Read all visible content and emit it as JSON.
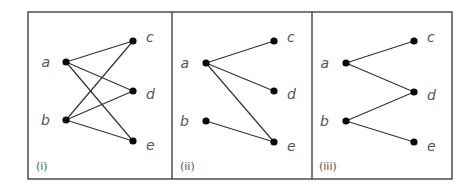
{
  "figure": {
    "frame": {
      "x": 28,
      "y": 12,
      "width": 424,
      "height": 167
    },
    "dividers": [
      172,
      312
    ],
    "colors": {
      "edge": "#333333",
      "node": "#0a0a0a",
      "text": "#555555",
      "frame": "#333333"
    },
    "panels": [
      {
        "id": "i",
        "label": "(i)",
        "label_pos": {
          "x": 36,
          "y": 170
        },
        "nodes": [
          {
            "id": "a",
            "label": "a",
            "x": 66,
            "y": 62,
            "lx": 50,
            "ly": 67
          },
          {
            "id": "b",
            "label": "b",
            "x": 66,
            "y": 120,
            "lx": 50,
            "ly": 125
          },
          {
            "id": "c",
            "label": "c",
            "x": 133,
            "y": 41,
            "lx": 146,
            "ly": 42
          },
          {
            "id": "d",
            "label": "d",
            "x": 133,
            "y": 91,
            "lx": 146,
            "ly": 99
          },
          {
            "id": "e",
            "label": "e",
            "x": 133,
            "y": 141,
            "lx": 146,
            "ly": 150
          }
        ],
        "edges": [
          [
            "a",
            "c"
          ],
          [
            "a",
            "d"
          ],
          [
            "a",
            "e"
          ],
          [
            "b",
            "c"
          ],
          [
            "b",
            "d"
          ],
          [
            "b",
            "e"
          ]
        ]
      },
      {
        "id": "ii",
        "label": "(ii)",
        "label_pos": {
          "x": 180,
          "y": 170
        },
        "nodes": [
          {
            "id": "a",
            "label": "a",
            "x": 206,
            "y": 63,
            "lx": 189,
            "ly": 68
          },
          {
            "id": "b",
            "label": "b",
            "x": 206,
            "y": 121,
            "lx": 189,
            "ly": 126
          },
          {
            "id": "c",
            "label": "c",
            "x": 274,
            "y": 41,
            "lx": 287,
            "ly": 42
          },
          {
            "id": "d",
            "label": "d",
            "x": 274,
            "y": 91,
            "lx": 287,
            "ly": 99
          },
          {
            "id": "e",
            "label": "e",
            "x": 274,
            "y": 142,
            "lx": 287,
            "ly": 151
          }
        ],
        "edges": [
          [
            "a",
            "c"
          ],
          [
            "a",
            "d"
          ],
          [
            "a",
            "e"
          ],
          [
            "b",
            "e"
          ]
        ]
      },
      {
        "id": "iii",
        "label": "(iii)",
        "label_pos": {
          "x": 319,
          "y": 170
        },
        "nodes": [
          {
            "id": "a",
            "label": "a",
            "x": 346,
            "y": 63,
            "lx": 329,
            "ly": 68
          },
          {
            "id": "b",
            "label": "b",
            "x": 346,
            "y": 121,
            "lx": 329,
            "ly": 126
          },
          {
            "id": "c",
            "label": "c",
            "x": 414,
            "y": 41,
            "lx": 427,
            "ly": 42
          },
          {
            "id": "d",
            "label": "d",
            "x": 414,
            "y": 92,
            "lx": 427,
            "ly": 100
          },
          {
            "id": "e",
            "label": "e",
            "x": 414,
            "y": 142,
            "lx": 427,
            "ly": 151
          }
        ],
        "edges": [
          [
            "a",
            "c"
          ],
          [
            "a",
            "d"
          ],
          [
            "b",
            "d"
          ],
          [
            "b",
            "e"
          ]
        ]
      }
    ]
  }
}
